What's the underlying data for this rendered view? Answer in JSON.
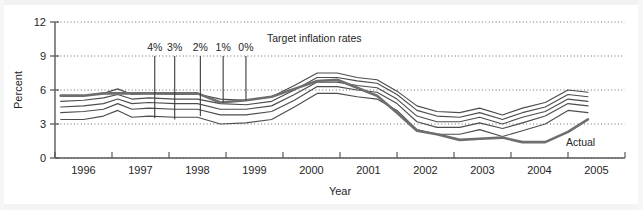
{
  "chart_data": {
    "type": "line",
    "title": "",
    "xlabel": "Year",
    "ylabel": "Percent",
    "xlim": [
      1995.5,
      2005.5
    ],
    "ylim": [
      0,
      12
    ],
    "yticks": [
      0,
      3,
      6,
      9,
      12
    ],
    "ytick_labels": [
      "0",
      "3",
      "6",
      "9",
      "12"
    ],
    "xticks": [
      1996,
      1997,
      1998,
      1999,
      2000,
      2001,
      2002,
      2003,
      2004,
      2005
    ],
    "xtick_labels": [
      "1996",
      "1997",
      "1998",
      "1999",
      "2000",
      "2001",
      "2002",
      "2003",
      "2004",
      "2005"
    ],
    "grid": "horizontal-dotted",
    "legend_position": "inline-annotations",
    "legend_title": "Target inflation rates",
    "target_rate_labels": [
      "4%",
      "3%",
      "2%",
      "1%",
      "0%"
    ],
    "actual_label": "Actual",
    "x": [
      1995.6,
      1996.0,
      1996.35,
      1996.6,
      1996.85,
      1997.15,
      1997.6,
      1998.0,
      1998.4,
      1998.85,
      1999.3,
      1999.7,
      2000.1,
      2000.45,
      2000.8,
      2001.15,
      2001.5,
      2001.85,
      2002.2,
      2002.6,
      2002.95,
      2003.35,
      2003.7,
      2004.1,
      2004.5,
      2004.85
    ],
    "series": [
      {
        "name": "4% target",
        "role": "fan-band",
        "values": [
          5.5,
          5.5,
          5.7,
          6.1,
          5.6,
          5.7,
          5.6,
          5.65,
          5.2,
          5.1,
          5.4,
          6.4,
          7.5,
          7.5,
          7.1,
          6.9,
          5.9,
          4.6,
          4.1,
          4.0,
          4.4,
          3.8,
          4.4,
          4.9,
          6.0,
          5.8
        ]
      },
      {
        "name": "3% target",
        "role": "fan-band",
        "values": [
          5.0,
          5.1,
          5.3,
          5.6,
          5.2,
          5.3,
          5.2,
          5.2,
          4.8,
          4.7,
          5.0,
          6.0,
          7.1,
          7.1,
          6.8,
          6.6,
          5.6,
          4.2,
          3.7,
          3.6,
          4.0,
          3.4,
          4.0,
          4.5,
          5.6,
          5.4
        ]
      },
      {
        "name": "2% target",
        "role": "fan-band",
        "values": [
          4.5,
          4.6,
          4.8,
          5.2,
          4.8,
          4.9,
          4.8,
          4.8,
          4.3,
          4.3,
          4.6,
          5.6,
          6.7,
          6.7,
          6.4,
          6.2,
          5.2,
          3.7,
          3.2,
          3.2,
          3.6,
          3.0,
          3.6,
          4.1,
          5.2,
          5.0
        ]
      },
      {
        "name": "1% target",
        "role": "fan-band",
        "values": [
          4.0,
          4.1,
          4.3,
          4.8,
          4.3,
          4.4,
          4.3,
          4.3,
          3.8,
          3.8,
          4.1,
          5.1,
          6.3,
          6.3,
          6.0,
          5.8,
          4.8,
          3.2,
          2.7,
          2.7,
          3.1,
          2.6,
          3.1,
          3.7,
          4.8,
          4.6
        ]
      },
      {
        "name": "0% target",
        "role": "fan-band",
        "values": [
          3.4,
          3.4,
          3.7,
          4.2,
          3.6,
          3.7,
          3.6,
          3.6,
          3.0,
          3.1,
          3.4,
          4.5,
          5.7,
          5.7,
          5.4,
          5.2,
          4.2,
          2.5,
          2.1,
          2.1,
          2.5,
          1.9,
          2.4,
          3.0,
          4.2,
          4.0
        ]
      },
      {
        "name": "Actual",
        "role": "actual",
        "values": [
          5.5,
          5.5,
          5.7,
          5.7,
          5.7,
          5.7,
          5.7,
          5.7,
          4.9,
          5.1,
          5.4,
          6.1,
          6.8,
          6.9,
          6.2,
          5.5,
          4.0,
          2.4,
          2.1,
          1.6,
          1.7,
          1.8,
          1.4,
          1.4,
          2.3,
          3.4
        ]
      }
    ],
    "annotations": [
      {
        "label": "4%",
        "x": 1997.25,
        "line_top": 9.0,
        "line_bottom": 3.5
      },
      {
        "label": "3%",
        "x": 1997.6,
        "line_top": 9.0,
        "line_bottom": 3.4
      },
      {
        "label": "2%",
        "x": 1998.05,
        "line_top": 9.0,
        "line_bottom": 3.7
      },
      {
        "label": "1%",
        "x": 1998.45,
        "line_top": 9.0,
        "line_bottom": 4.9
      },
      {
        "label": "0%",
        "x": 1998.85,
        "line_top": 9.0,
        "line_bottom": 5.1
      }
    ]
  },
  "colors": {
    "fan_line": "#4d4d4d",
    "actual_line": "#6e6e6e",
    "axis": "#5a5a5a",
    "grid": "#6b6b6b",
    "text": "#262626"
  }
}
